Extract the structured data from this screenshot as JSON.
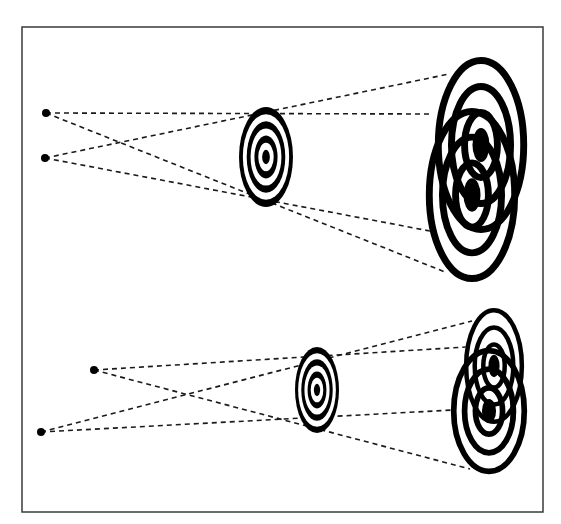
{
  "figure": {
    "frame": {
      "x": 22,
      "y": 27,
      "width": 521,
      "height": 485,
      "stroke": "#3a3a3a"
    },
    "ink_color": "#000000",
    "background": "#ffffff",
    "panels": [
      {
        "id": "top",
        "sources": [
          {
            "x": 46,
            "y": 113,
            "r": 4
          },
          {
            "x": 45,
            "y": 158,
            "r": 4
          }
        ],
        "aperture": {
          "cx": 266,
          "cy": 157,
          "rx": 27,
          "ry": 50,
          "rings": 4
        },
        "shadows": [
          {
            "cx": 481,
            "cy": 145,
            "rx": 46,
            "ry": 91,
            "rings": 4
          },
          {
            "cx": 472,
            "cy": 195,
            "rx": 46,
            "ry": 90,
            "rings": 4
          }
        ],
        "rays": [
          {
            "x1": 46,
            "y1": 113,
            "x2": 431,
            "y2": 114
          },
          {
            "x1": 46,
            "y1": 113,
            "x2": 445,
            "y2": 272
          },
          {
            "x1": 45,
            "y1": 158,
            "x2": 449,
            "y2": 74
          },
          {
            "x1": 45,
            "y1": 158,
            "x2": 430,
            "y2": 231
          }
        ]
      },
      {
        "id": "bottom",
        "sources": [
          {
            "x": 94,
            "y": 370,
            "r": 4
          },
          {
            "x": 41,
            "y": 432,
            "r": 4
          }
        ],
        "aperture": {
          "cx": 317,
          "cy": 390,
          "rx": 22,
          "ry": 43,
          "rings": 4
        },
        "shadows": [
          {
            "cx": 494,
            "cy": 366,
            "rx": 30,
            "ry": 60,
            "rings": 4
          },
          {
            "cx": 489,
            "cy": 411,
            "rx": 38,
            "ry": 65,
            "rings": 4
          }
        ],
        "rays": [
          {
            "x1": 94,
            "y1": 370,
            "x2": 466,
            "y2": 347
          },
          {
            "x1": 94,
            "y1": 370,
            "x2": 470,
            "y2": 469
          },
          {
            "x1": 41,
            "y1": 432,
            "x2": 472,
            "y2": 321
          },
          {
            "x1": 41,
            "y1": 432,
            "x2": 453,
            "y2": 410
          }
        ]
      }
    ]
  }
}
